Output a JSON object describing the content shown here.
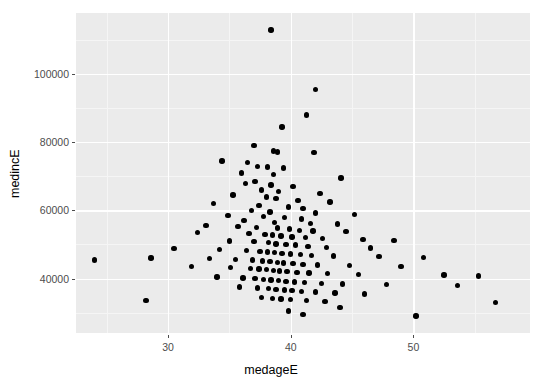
{
  "chart_data": {
    "type": "scatter",
    "title": "",
    "xlabel": "medageE",
    "ylabel": "medincE",
    "xlim": [
      22.5,
      59.5
    ],
    "ylim": [
      24000,
      118000
    ],
    "xticks": [
      30,
      40,
      50
    ],
    "yticks": [
      40000,
      60000,
      80000,
      100000
    ],
    "xtick_labels": [
      "30",
      "40",
      "50"
    ],
    "ytick_labels": [
      "40000",
      "60000",
      "80000",
      "100000"
    ],
    "grid": true,
    "legend": "none",
    "point_color": "#000000",
    "panel_color": "#EBEBEB",
    "gridline_color": "#FFFFFF",
    "n_points": 146,
    "points": [
      [
        38.4,
        113000
      ],
      [
        42.0,
        95500
      ],
      [
        41.3,
        88000
      ],
      [
        39.3,
        84500
      ],
      [
        37.0,
        79000
      ],
      [
        38.6,
        77500
      ],
      [
        38.9,
        77200
      ],
      [
        41.9,
        77000
      ],
      [
        34.4,
        74500
      ],
      [
        36.5,
        74000
      ],
      [
        37.3,
        73000
      ],
      [
        38.1,
        72800
      ],
      [
        39.4,
        72500
      ],
      [
        36.0,
        71000
      ],
      [
        38.6,
        70500
      ],
      [
        44.1,
        69500
      ],
      [
        37.1,
        68500
      ],
      [
        36.3,
        68000
      ],
      [
        38.4,
        67500
      ],
      [
        40.2,
        67000
      ],
      [
        37.6,
        66000
      ],
      [
        39.0,
        65500
      ],
      [
        42.4,
        65000
      ],
      [
        35.3,
        64500
      ],
      [
        38.0,
        64000
      ],
      [
        38.8,
        63500
      ],
      [
        40.6,
        63000
      ],
      [
        43.2,
        62500
      ],
      [
        33.7,
        62000
      ],
      [
        37.4,
        61500
      ],
      [
        39.8,
        61000
      ],
      [
        41.0,
        60500
      ],
      [
        36.8,
        60000
      ],
      [
        38.3,
        59500
      ],
      [
        42.0,
        59200
      ],
      [
        45.2,
        58800
      ],
      [
        34.9,
        58500
      ],
      [
        37.8,
        58200
      ],
      [
        39.5,
        58000
      ],
      [
        40.9,
        57500
      ],
      [
        36.2,
        57000
      ],
      [
        38.7,
        56500
      ],
      [
        41.6,
        56200
      ],
      [
        43.8,
        56000
      ],
      [
        33.1,
        55500
      ],
      [
        35.7,
        55200
      ],
      [
        37.2,
        55000
      ],
      [
        38.9,
        54800
      ],
      [
        39.9,
        54500
      ],
      [
        40.7,
        54200
      ],
      [
        41.8,
        54000
      ],
      [
        44.5,
        53800
      ],
      [
        32.4,
        53500
      ],
      [
        36.6,
        53200
      ],
      [
        37.9,
        53000
      ],
      [
        38.5,
        52800
      ],
      [
        39.2,
        52500
      ],
      [
        40.1,
        52200
      ],
      [
        41.2,
        52000
      ],
      [
        42.6,
        51800
      ],
      [
        45.9,
        51500
      ],
      [
        48.4,
        51200
      ],
      [
        35.0,
        51000
      ],
      [
        37.0,
        50800
      ],
      [
        38.2,
        50500
      ],
      [
        38.8,
        50200
      ],
      [
        39.6,
        50000
      ],
      [
        40.4,
        49800
      ],
      [
        41.4,
        49500
      ],
      [
        42.9,
        49200
      ],
      [
        46.5,
        49000
      ],
      [
        30.5,
        48800
      ],
      [
        34.2,
        48500
      ],
      [
        36.4,
        48200
      ],
      [
        37.5,
        48000
      ],
      [
        38.1,
        47800
      ],
      [
        38.7,
        47600
      ],
      [
        39.3,
        47400
      ],
      [
        40.0,
        47200
      ],
      [
        40.8,
        47000
      ],
      [
        41.7,
        46800
      ],
      [
        43.5,
        46600
      ],
      [
        47.2,
        46400
      ],
      [
        50.8,
        46200
      ],
      [
        28.6,
        46000
      ],
      [
        33.4,
        45800
      ],
      [
        35.5,
        45600
      ],
      [
        36.9,
        45400
      ],
      [
        37.7,
        45200
      ],
      [
        38.3,
        45000
      ],
      [
        38.9,
        44800
      ],
      [
        39.4,
        44600
      ],
      [
        40.2,
        44400
      ],
      [
        41.0,
        44200
      ],
      [
        42.2,
        44000
      ],
      [
        44.8,
        43800
      ],
      [
        49.0,
        43600
      ],
      [
        24.0,
        45500
      ],
      [
        31.9,
        43500
      ],
      [
        35.1,
        43200
      ],
      [
        36.7,
        43000
      ],
      [
        37.4,
        42800
      ],
      [
        38.0,
        42600
      ],
      [
        38.6,
        42400
      ],
      [
        39.1,
        42200
      ],
      [
        39.7,
        42000
      ],
      [
        40.5,
        41800
      ],
      [
        41.5,
        41600
      ],
      [
        43.0,
        41400
      ],
      [
        45.5,
        41200
      ],
      [
        52.5,
        41000
      ],
      [
        55.3,
        40800
      ],
      [
        34.0,
        40500
      ],
      [
        36.1,
        40200
      ],
      [
        37.1,
        40000
      ],
      [
        37.8,
        39800
      ],
      [
        38.4,
        39600
      ],
      [
        39.0,
        39400
      ],
      [
        39.6,
        39200
      ],
      [
        40.3,
        39000
      ],
      [
        41.1,
        38800
      ],
      [
        42.5,
        38600
      ],
      [
        44.2,
        38400
      ],
      [
        47.8,
        38200
      ],
      [
        53.6,
        38000
      ],
      [
        35.8,
        37500
      ],
      [
        37.3,
        37200
      ],
      [
        38.2,
        37000
      ],
      [
        38.8,
        36800
      ],
      [
        39.5,
        36600
      ],
      [
        40.1,
        36400
      ],
      [
        40.9,
        36200
      ],
      [
        42.0,
        36000
      ],
      [
        43.6,
        35800
      ],
      [
        46.0,
        35500
      ],
      [
        28.2,
        33500
      ],
      [
        37.6,
        34500
      ],
      [
        38.5,
        34200
      ],
      [
        39.2,
        34000
      ],
      [
        40.0,
        33800
      ],
      [
        41.3,
        33500
      ],
      [
        42.8,
        33200
      ],
      [
        44.0,
        31500
      ],
      [
        39.8,
        30500
      ],
      [
        41.0,
        29500
      ],
      [
        56.7,
        33000
      ],
      [
        50.2,
        29000
      ]
    ]
  },
  "axes": {
    "panel": {
      "left": 76,
      "top": 13,
      "right": 530,
      "bottom": 333
    }
  }
}
